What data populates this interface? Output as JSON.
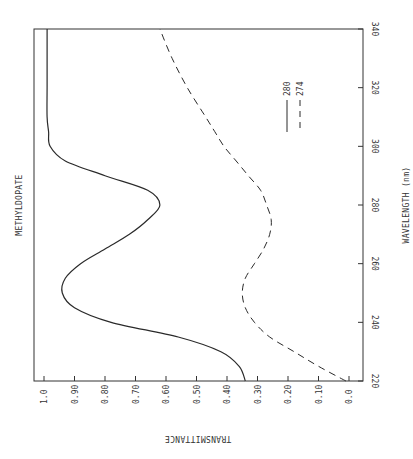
{
  "chart_data": {
    "type": "line",
    "orientation": "rotated 90 degrees clockwise (wavelength axis vertical on right, transmittance axis horizontal at bottom, reversed)",
    "title": "METHYLDOPATE",
    "xlabel": "WAVELENGTH (nm)",
    "ylabel": "TRANSMITTANCE",
    "xlim": [
      220,
      340
    ],
    "ylim": [
      0.0,
      1.0
    ],
    "x_ticks": [
      "220",
      "240",
      "260",
      "280",
      "300",
      "320",
      "340"
    ],
    "y_ticks": [
      "0.0",
      "0.10",
      "0.20",
      "0.30",
      "0.40",
      "0.50",
      "0.60",
      "0.70",
      "0.80",
      "0.90",
      "1.0"
    ],
    "grid": false,
    "legend_position": "inside, upper-right region",
    "x": [
      220,
      225,
      230,
      235,
      240,
      245,
      250,
      255,
      260,
      265,
      270,
      275,
      280,
      285,
      290,
      295,
      300,
      305,
      310,
      320,
      330,
      340
    ],
    "series": [
      {
        "name": "280",
        "style": "solid",
        "values": [
          0.34,
          0.36,
          0.42,
          0.56,
          0.78,
          0.9,
          0.94,
          0.93,
          0.88,
          0.8,
          0.72,
          0.66,
          0.62,
          0.66,
          0.8,
          0.93,
          0.98,
          0.985,
          0.99,
          0.99,
          0.99,
          0.99
        ]
      },
      {
        "name": "274",
        "style": "dashed",
        "values": [
          0.01,
          0.1,
          0.18,
          0.26,
          0.31,
          0.34,
          0.35,
          0.34,
          0.31,
          0.28,
          0.26,
          0.255,
          0.27,
          0.29,
          0.33,
          0.37,
          0.41,
          0.44,
          0.47,
          0.53,
          0.58,
          0.62
        ]
      }
    ]
  },
  "labels": {
    "title": "METHYLDOPATE",
    "x_axis_title": "WAVELENGTH (nm)",
    "y_axis_title": "TRANSMITTANCE",
    "legend": [
      {
        "label": "280",
        "style": "solid"
      },
      {
        "label": "274",
        "style": "dashed"
      }
    ]
  }
}
